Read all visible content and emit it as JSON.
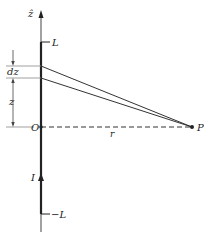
{
  "diagram": {
    "type": "biot-savart-finite-wire",
    "axis_label": "ẑ",
    "labels": {
      "top_end": "L",
      "bottom_end": "−L",
      "element": "dz",
      "height": "z",
      "origin": "O",
      "current": "I",
      "distance": "r",
      "point": "P"
    },
    "colors": {
      "ink": "#222222",
      "guide": "#888888",
      "background": "#ffffff"
    }
  }
}
